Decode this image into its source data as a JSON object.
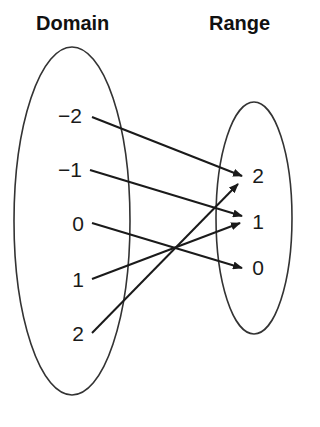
{
  "diagram": {
    "type": "mapping-diagram",
    "domain_title": "Domain",
    "range_title": "Range",
    "domain": [
      {
        "label": "−2",
        "x": 70,
        "y": 116
      },
      {
        "label": "−1",
        "x": 70,
        "y": 170
      },
      {
        "label": "0",
        "x": 78,
        "y": 224
      },
      {
        "label": "1",
        "x": 78,
        "y": 280
      },
      {
        "label": "2",
        "x": 78,
        "y": 334
      }
    ],
    "range": [
      {
        "label": "2",
        "x": 258,
        "y": 176
      },
      {
        "label": "1",
        "x": 258,
        "y": 222
      },
      {
        "label": "0",
        "x": 258,
        "y": 268
      }
    ],
    "mappings": [
      {
        "from": "−2",
        "to": "2"
      },
      {
        "from": "−1",
        "to": "1"
      },
      {
        "from": "0",
        "to": "0"
      },
      {
        "from": "1",
        "to": "1"
      },
      {
        "from": "2",
        "to": "2"
      }
    ],
    "colors": {
      "stroke": "#1a1a1a",
      "background": "#ffffff"
    }
  }
}
